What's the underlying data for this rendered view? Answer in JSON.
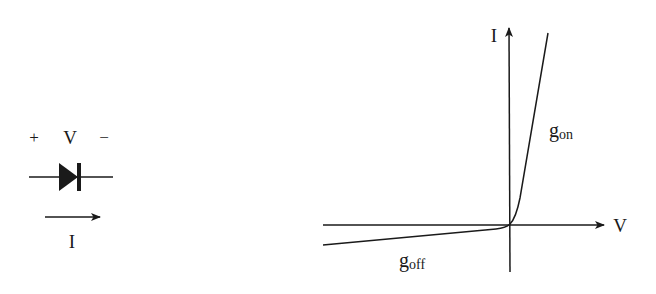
{
  "diode_symbol": {
    "plus_sign": "+",
    "voltage_label": "V",
    "minus_sign": "−",
    "current_label": "I",
    "icons": [
      "diode-icon",
      "current-arrow-icon"
    ]
  },
  "iv_plot": {
    "y_axis_label": "I",
    "x_axis_label": "V",
    "on_conductance_label": {
      "main": "g",
      "sub": "on"
    },
    "off_conductance_label": {
      "main": "g",
      "sub": "off"
    }
  },
  "colors": {
    "stroke": "#1a1a1a",
    "background": "#ffffff"
  }
}
